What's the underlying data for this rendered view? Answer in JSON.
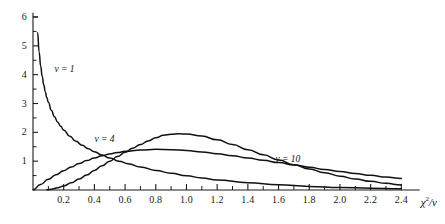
{
  "chart_data": {
    "type": "line",
    "title": "",
    "subtitle": "",
    "xlabel": "χ²/ν",
    "ylabel": "",
    "xlim": [
      0,
      2.5
    ],
    "ylim": [
      0,
      6.2
    ],
    "grid": false,
    "legend_position": "inline-annotations",
    "x_ticks": [
      "0.2",
      "0.4",
      "0.6",
      "0.8",
      "1.0",
      "1.2",
      "1.4",
      "1.6",
      "1.8",
      "2.0",
      "2.2",
      "2.4"
    ],
    "x_tick_values": [
      0.2,
      0.4,
      0.6,
      0.8,
      1.0,
      1.2,
      1.4,
      1.6,
      1.8,
      2.0,
      2.2,
      2.4
    ],
    "x_minor_tick_step": 0.1,
    "y_ticks": [
      "1",
      "2",
      "3",
      "4",
      "5",
      "6"
    ],
    "y_tick_values": [
      1,
      2,
      3,
      4,
      5,
      6
    ],
    "y_minor_tick_step": 0.25,
    "annotations": [
      {
        "text": "ν = 1",
        "x": 0.14,
        "y": 4.15
      },
      {
        "text": "ν = 4",
        "x": 0.4,
        "y": 1.72
      },
      {
        "text": "ν = 10",
        "x": 1.58,
        "y": 1.05
      }
    ],
    "series": [
      {
        "name": "ν = 1",
        "label": "ν = 1",
        "color": "#111111",
        "peak": {
          "x": 0.03,
          "y": 5.45
        },
        "x": [
          0.03,
          0.04,
          0.05,
          0.06,
          0.07,
          0.08,
          0.09,
          0.1,
          0.12,
          0.14,
          0.16,
          0.18,
          0.2,
          0.24,
          0.28,
          0.32,
          0.36,
          0.4,
          0.45,
          0.5,
          0.56,
          0.62,
          0.7,
          0.8,
          0.9,
          1.0,
          1.1,
          1.2,
          1.4,
          1.6,
          1.8,
          2.0,
          2.2,
          2.4
        ],
        "y": [
          5.45,
          4.78,
          4.3,
          3.94,
          3.65,
          3.41,
          3.21,
          3.04,
          2.76,
          2.54,
          2.36,
          2.21,
          2.08,
          1.86,
          1.69,
          1.55,
          1.43,
          1.33,
          1.21,
          1.11,
          1.0,
          0.91,
          0.8,
          0.68,
          0.58,
          0.49,
          0.42,
          0.35,
          0.25,
          0.18,
          0.125,
          0.088,
          0.061,
          0.042
        ]
      },
      {
        "name": "ν = 4",
        "label": "ν = 4",
        "color": "#111111",
        "peak": {
          "x": 0.5,
          "y": 1.46
        },
        "x": [
          0.0,
          0.05,
          0.1,
          0.15,
          0.2,
          0.25,
          0.3,
          0.35,
          0.4,
          0.45,
          0.5,
          0.55,
          0.6,
          0.7,
          0.8,
          0.9,
          1.0,
          1.1,
          1.2,
          1.3,
          1.4,
          1.5,
          1.6,
          1.7,
          1.8,
          1.9,
          2.0,
          2.1,
          2.2,
          2.3,
          2.4
        ],
        "y": [
          0.0,
          0.195,
          0.37,
          0.53,
          0.67,
          0.8,
          0.92,
          1.02,
          1.11,
          1.19,
          1.25,
          1.3,
          1.34,
          1.39,
          1.41,
          1.4,
          1.37,
          1.32,
          1.26,
          1.19,
          1.11,
          1.03,
          0.95,
          0.87,
          0.79,
          0.71,
          0.64,
          0.57,
          0.51,
          0.45,
          0.4
        ]
      },
      {
        "name": "ν = 10",
        "label": "ν = 10",
        "color": "#111111",
        "peak": {
          "x": 0.85,
          "y": 1.95
        },
        "x": [
          0.09,
          0.12,
          0.16,
          0.2,
          0.25,
          0.3,
          0.35,
          0.4,
          0.45,
          0.5,
          0.55,
          0.6,
          0.65,
          0.7,
          0.75,
          0.8,
          0.85,
          0.9,
          0.95,
          1.0,
          1.1,
          1.2,
          1.3,
          1.4,
          1.5,
          1.6,
          1.7,
          1.8,
          1.9,
          2.0,
          2.1,
          2.2,
          2.3,
          2.4
        ],
        "y": [
          0.01,
          0.03,
          0.075,
          0.14,
          0.25,
          0.38,
          0.52,
          0.68,
          0.84,
          1.0,
          1.16,
          1.31,
          1.45,
          1.58,
          1.7,
          1.81,
          1.9,
          1.93,
          1.95,
          1.94,
          1.87,
          1.74,
          1.58,
          1.4,
          1.22,
          1.04,
          0.88,
          0.73,
          0.6,
          0.48,
          0.38,
          0.3,
          0.23,
          0.175
        ]
      }
    ]
  },
  "axis": {
    "x_title": "χ²/ν",
    "x_title_chi": "χ",
    "x_title_exp": "2",
    "x_title_div": "/",
    "x_title_nu": "ν"
  }
}
